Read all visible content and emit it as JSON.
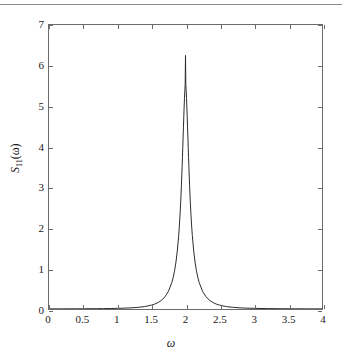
{
  "figure": {
    "rule_color": "#8c8c8c",
    "axis_color": "#6b6b6b",
    "curve_color": "#2b2b2b",
    "background": "#ffffff"
  },
  "chart_data": {
    "type": "line",
    "title": "",
    "subtitle": "",
    "xlabel": "ω",
    "ylabel": "S₁₁(ω)",
    "ylabel_parts": {
      "symbol": "S",
      "subscript": "11",
      "argument": "(ω)"
    },
    "xlim": [
      0,
      4
    ],
    "ylim": [
      0,
      7
    ],
    "xticks": [
      0,
      0.5,
      1,
      1.5,
      2,
      2.5,
      3,
      3.5,
      4
    ],
    "xtick_labels": [
      "0",
      "0.5",
      "1",
      "1.5",
      "2",
      "2.5",
      "3",
      "3.5",
      "4"
    ],
    "yticks": [
      0,
      1,
      2,
      3,
      4,
      5,
      6,
      7
    ],
    "ytick_labels": [
      "0",
      "1",
      "2",
      "3",
      "4",
      "5",
      "6",
      "7"
    ],
    "grid": false,
    "legend": null,
    "legend_position": "none",
    "tick_direction": "in",
    "frame": "box",
    "annotations": [],
    "series": [
      {
        "name": "S11",
        "color": "#2b2b2b",
        "linewidth": 1,
        "peak_x": 2.0,
        "peak_y": 6.25,
        "half_width_at_half_max": 0.05,
        "description": "Lorentzian resonance peak centred at omega = 2 with near-zero baseline",
        "x": [
          0.0,
          0.1,
          0.2,
          0.3,
          0.4,
          0.5,
          0.6,
          0.7,
          0.8,
          0.9,
          1.0,
          1.1,
          1.2,
          1.3,
          1.4,
          1.5,
          1.55,
          1.6,
          1.65,
          1.7,
          1.75,
          1.8,
          1.82,
          1.84,
          1.86,
          1.88,
          1.9,
          1.91,
          1.92,
          1.93,
          1.94,
          1.95,
          1.955,
          1.96,
          1.965,
          1.97,
          1.975,
          1.98,
          1.985,
          1.99,
          1.995,
          2.0,
          2.005,
          2.01,
          2.015,
          2.02,
          2.025,
          2.03,
          2.035,
          2.04,
          2.045,
          2.05,
          2.06,
          2.07,
          2.08,
          2.09,
          2.1,
          2.12,
          2.14,
          2.16,
          2.18,
          2.2,
          2.25,
          2.3,
          2.35,
          2.4,
          2.45,
          2.5,
          2.6,
          2.7,
          2.8,
          2.9,
          3.0,
          3.2,
          3.4,
          3.6,
          3.8,
          4.0
        ],
        "y": [
          0.004,
          0.004,
          0.004,
          0.005,
          0.005,
          0.006,
          0.007,
          0.008,
          0.01,
          0.012,
          0.016,
          0.021,
          0.028,
          0.04,
          0.059,
          0.095,
          0.122,
          0.161,
          0.217,
          0.302,
          0.435,
          0.655,
          0.782,
          0.944,
          1.154,
          1.432,
          1.807,
          2.045,
          2.325,
          2.655,
          3.041,
          3.486,
          3.729,
          3.98,
          4.236,
          4.492,
          4.742,
          4.978,
          5.192,
          5.378,
          5.527,
          6.25,
          5.527,
          5.378,
          5.192,
          4.978,
          4.742,
          4.492,
          4.236,
          3.98,
          3.729,
          3.486,
          3.041,
          2.655,
          2.325,
          2.045,
          1.807,
          1.432,
          1.154,
          0.944,
          0.782,
          0.655,
          0.435,
          0.302,
          0.217,
          0.161,
          0.122,
          0.095,
          0.059,
          0.04,
          0.028,
          0.021,
          0.016,
          0.01,
          0.007,
          0.005,
          0.004,
          0.003
        ]
      }
    ]
  }
}
